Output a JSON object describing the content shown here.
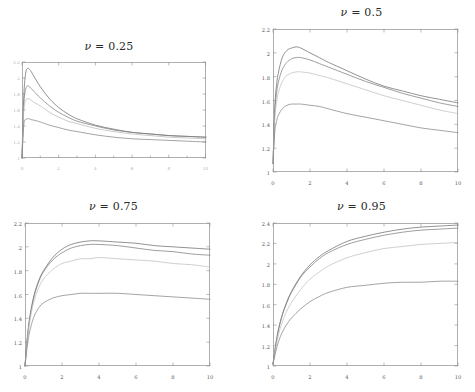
{
  "figure": {
    "background_color": "#ffffff",
    "layout": "2x2-grid-of-line-charts",
    "panel_count": 4
  },
  "chart_data": [
    {
      "type": "line",
      "panel_id": "nu-0.25",
      "title": "ν = 0.25",
      "title_symbol": "ν",
      "title_value": "0.25",
      "xlabel": "",
      "ylabel": "",
      "xlim": [
        0,
        10
      ],
      "ylim": [
        1,
        2.2
      ],
      "grid": false,
      "legend": "none",
      "xticks": [
        0,
        2,
        4,
        6,
        8,
        10
      ],
      "xticklabels": [
        "0",
        "2",
        "4",
        "6",
        "8",
        "10"
      ],
      "yticks": [
        1,
        1.2,
        1.4,
        1.6,
        1.8,
        2,
        2.2
      ],
      "yticklabels": [
        "1",
        "1.2",
        "1.4",
        "1.6",
        "1.8",
        "2",
        "2.2"
      ],
      "ticklabels_legible": false,
      "x": [
        0,
        0.1,
        0.2,
        0.3,
        0.4,
        0.5,
        0.7,
        1,
        1.5,
        2,
        2.5,
        3,
        4,
        5,
        6,
        7,
        8,
        9,
        10
      ],
      "series": [
        {
          "name": "curve-1",
          "color": "#6e6e6e",
          "values": [
            1.0,
            1.78,
            2.06,
            2.12,
            2.11,
            2.08,
            2.0,
            1.89,
            1.74,
            1.63,
            1.55,
            1.49,
            1.41,
            1.36,
            1.32,
            1.3,
            1.28,
            1.27,
            1.26
          ]
        },
        {
          "name": "curve-2",
          "color": "#7d7d7d",
          "values": [
            1.0,
            1.68,
            1.86,
            1.9,
            1.89,
            1.87,
            1.82,
            1.75,
            1.65,
            1.57,
            1.51,
            1.46,
            1.4,
            1.35,
            1.32,
            1.3,
            1.28,
            1.27,
            1.26
          ]
        },
        {
          "name": "curve-3",
          "color": "#b9b9b9",
          "values": [
            1.0,
            1.6,
            1.72,
            1.74,
            1.74,
            1.72,
            1.69,
            1.65,
            1.57,
            1.51,
            1.46,
            1.43,
            1.37,
            1.33,
            1.3,
            1.28,
            1.26,
            1.25,
            1.24
          ]
        },
        {
          "name": "curve-4",
          "color": "#868686",
          "values": [
            1.0,
            1.42,
            1.48,
            1.49,
            1.49,
            1.48,
            1.47,
            1.45,
            1.41,
            1.38,
            1.35,
            1.33,
            1.29,
            1.26,
            1.24,
            1.23,
            1.22,
            1.21,
            1.2
          ]
        }
      ]
    },
    {
      "type": "line",
      "panel_id": "nu-0.5",
      "title": "ν = 0.5",
      "title_symbol": "ν",
      "title_value": "0.5",
      "xlabel": "",
      "ylabel": "",
      "xlim": [
        0,
        10
      ],
      "ylim": [
        1,
        2.2
      ],
      "grid": false,
      "legend": "none",
      "xticks": [
        0,
        2,
        4,
        6,
        8,
        10
      ],
      "xticklabels": [
        "0",
        "2",
        "4",
        "6",
        "8",
        "10"
      ],
      "yticks": [
        1,
        1.2,
        1.4,
        1.6,
        1.8,
        2,
        2.2
      ],
      "yticklabels": [
        "1",
        "1.2",
        "1.4",
        "1.6",
        "1.8",
        "2",
        "2.2"
      ],
      "ticklabels_legible": true,
      "x": [
        0,
        0.1,
        0.2,
        0.3,
        0.5,
        0.75,
        1,
        1.25,
        1.5,
        2,
        2.5,
        3,
        4,
        5,
        6,
        7,
        8,
        9,
        10
      ],
      "series": [
        {
          "name": "curve-1",
          "color": "#6e6e6e",
          "values": [
            1.07,
            1.55,
            1.74,
            1.84,
            1.96,
            2.02,
            2.04,
            2.05,
            2.04,
            2.0,
            1.96,
            1.92,
            1.85,
            1.78,
            1.72,
            1.68,
            1.64,
            1.61,
            1.58
          ]
        },
        {
          "name": "curve-2",
          "color": "#7d7d7d",
          "values": [
            1.07,
            1.5,
            1.67,
            1.76,
            1.86,
            1.92,
            1.95,
            1.96,
            1.96,
            1.94,
            1.91,
            1.88,
            1.82,
            1.76,
            1.71,
            1.66,
            1.62,
            1.58,
            1.55
          ]
        },
        {
          "name": "curve-3",
          "color": "#bfbfbf",
          "values": [
            1.07,
            1.45,
            1.59,
            1.67,
            1.76,
            1.81,
            1.83,
            1.84,
            1.84,
            1.83,
            1.81,
            1.79,
            1.74,
            1.69,
            1.64,
            1.6,
            1.56,
            1.52,
            1.49
          ]
        },
        {
          "name": "curve-4",
          "color": "#868686",
          "values": [
            1.07,
            1.34,
            1.43,
            1.48,
            1.53,
            1.56,
            1.57,
            1.57,
            1.57,
            1.56,
            1.55,
            1.53,
            1.49,
            1.46,
            1.43,
            1.4,
            1.37,
            1.35,
            1.33
          ]
        }
      ]
    },
    {
      "type": "line",
      "panel_id": "nu-0.75",
      "title": "ν = 0.75",
      "title_symbol": "ν",
      "title_value": "0.75",
      "xlabel": "",
      "ylabel": "",
      "xlim": [
        0,
        10
      ],
      "ylim": [
        1,
        2.2
      ],
      "grid": false,
      "legend": "none",
      "xticks": [
        0,
        2,
        4,
        6,
        8,
        10
      ],
      "xticklabels": [
        "0",
        "2",
        "4",
        "6",
        "8",
        "10"
      ],
      "yticks": [
        1,
        1.2,
        1.4,
        1.6,
        1.8,
        2,
        2.2
      ],
      "yticklabels": [
        "1",
        "1.2",
        "1.4",
        "1.6",
        "1.8",
        "2",
        "2.2"
      ],
      "ticklabels_legible": true,
      "x": [
        0,
        0.15,
        0.3,
        0.5,
        0.75,
        1,
        1.5,
        2,
        2.5,
        3,
        3.5,
        4,
        5,
        6,
        7,
        8,
        9,
        10
      ],
      "series": [
        {
          "name": "curve-1",
          "color": "#6e6e6e",
          "values": [
            1.0,
            1.28,
            1.45,
            1.6,
            1.72,
            1.8,
            1.91,
            1.98,
            2.02,
            2.04,
            2.05,
            2.05,
            2.04,
            2.03,
            2.01,
            2.0,
            1.99,
            1.98
          ]
        },
        {
          "name": "curve-2",
          "color": "#7d7d7d",
          "values": [
            1.0,
            1.27,
            1.44,
            1.59,
            1.71,
            1.79,
            1.89,
            1.95,
            1.99,
            2.01,
            2.02,
            2.02,
            2.01,
            1.99,
            1.97,
            1.96,
            1.94,
            1.93
          ]
        },
        {
          "name": "curve-3",
          "color": "#bfbfbf",
          "values": [
            1.0,
            1.25,
            1.41,
            1.55,
            1.66,
            1.73,
            1.81,
            1.86,
            1.88,
            1.9,
            1.9,
            1.91,
            1.9,
            1.89,
            1.88,
            1.86,
            1.85,
            1.83
          ]
        },
        {
          "name": "curve-4",
          "color": "#868686",
          "values": [
            1.0,
            1.2,
            1.32,
            1.42,
            1.49,
            1.53,
            1.57,
            1.59,
            1.6,
            1.61,
            1.61,
            1.61,
            1.61,
            1.6,
            1.59,
            1.58,
            1.57,
            1.56
          ]
        }
      ]
    },
    {
      "type": "line",
      "panel_id": "nu-0.95",
      "title": "ν = 0.95",
      "title_symbol": "ν",
      "title_value": "0.95",
      "xlabel": "",
      "ylabel": "",
      "xlim": [
        0,
        10
      ],
      "ylim": [
        1,
        2.4
      ],
      "grid": false,
      "legend": "none",
      "xticks": [
        0,
        2,
        4,
        6,
        8,
        10
      ],
      "xticklabels": [
        "0",
        "2",
        "4",
        "6",
        "8",
        "10"
      ],
      "yticks": [
        1,
        1.2,
        1.4,
        1.6,
        1.8,
        2,
        2.2,
        2.4
      ],
      "yticklabels": [
        "1",
        "1.2",
        "1.4",
        "1.6",
        "1.8",
        "2",
        "2.2",
        "2.4"
      ],
      "ticklabels_legible": true,
      "x": [
        0,
        0.15,
        0.3,
        0.5,
        0.75,
        1,
        1.5,
        2,
        2.5,
        3,
        4,
        5,
        6,
        7,
        8,
        9,
        10
      ],
      "series": [
        {
          "name": "curve-1",
          "color": "#6e6e6e",
          "values": [
            1.02,
            1.21,
            1.36,
            1.5,
            1.63,
            1.73,
            1.88,
            1.99,
            2.07,
            2.13,
            2.22,
            2.27,
            2.31,
            2.34,
            2.36,
            2.37,
            2.38
          ]
        },
        {
          "name": "curve-2",
          "color": "#7d7d7d",
          "values": [
            1.02,
            1.21,
            1.36,
            1.5,
            1.62,
            1.72,
            1.87,
            1.97,
            2.05,
            2.11,
            2.19,
            2.24,
            2.28,
            2.31,
            2.33,
            2.34,
            2.35
          ]
        },
        {
          "name": "curve-3",
          "color": "#bfbfbf",
          "values": [
            1.02,
            1.18,
            1.31,
            1.43,
            1.54,
            1.62,
            1.75,
            1.85,
            1.92,
            1.98,
            2.06,
            2.11,
            2.15,
            2.17,
            2.19,
            2.2,
            2.21
          ]
        },
        {
          "name": "curve-4",
          "color": "#868686",
          "values": [
            1.02,
            1.14,
            1.24,
            1.33,
            1.41,
            1.47,
            1.56,
            1.63,
            1.68,
            1.72,
            1.77,
            1.79,
            1.81,
            1.82,
            1.82,
            1.83,
            1.83
          ]
        }
      ]
    }
  ]
}
